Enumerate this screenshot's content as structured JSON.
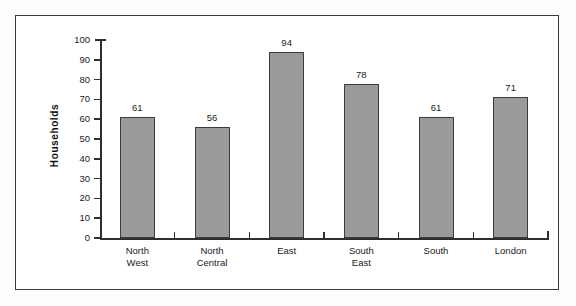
{
  "chart_data": {
    "type": "bar",
    "title": "",
    "subtitle": "",
    "xlabel": "",
    "ylabel": "Households",
    "categories": [
      "North West",
      "North Central",
      "East",
      "South East",
      "South",
      "London"
    ],
    "category_lines": [
      [
        "North",
        "West"
      ],
      [
        "North",
        "Central"
      ],
      [
        "East"
      ],
      [
        "South",
        "East"
      ],
      [
        "South"
      ],
      [
        "London"
      ]
    ],
    "values": [
      61,
      56,
      94,
      78,
      61,
      71
    ],
    "value_labels": [
      "61",
      "56",
      "94",
      "78",
      "61",
      "71"
    ],
    "ylim": [
      0,
      100
    ],
    "ytick_step": 10,
    "ytick_labels": [
      "0",
      "10",
      "20",
      "30",
      "40",
      "50",
      "60",
      "70",
      "80",
      "90",
      "100"
    ],
    "grid": false,
    "legend": null,
    "legend_position": "none",
    "bar_fill_color": "#9a9a9a",
    "bar_edge_color": "#3c3c3c",
    "axis_color": "#2f2f2f",
    "frame_color": "#3a3a3a",
    "background_color": "#ffffff"
  }
}
